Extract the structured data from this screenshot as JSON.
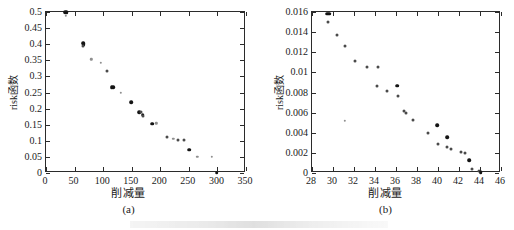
{
  "figure": {
    "background_color": "#ffffff",
    "marker_color": "#4a4a4a",
    "marker_color_dark": "#141414",
    "marker_color_light": "#8f8f8f",
    "axis_color": "#2b2b2b",
    "footer_artifact_label": "cut-off-caption-artifact"
  },
  "chart_data": [
    {
      "type": "scatter",
      "panel": "a",
      "caption": "(a)",
      "title": "",
      "xlabel": "削减量",
      "ylabel": "risk函数",
      "xlim": [
        0,
        350
      ],
      "ylim": [
        0,
        0.5
      ],
      "xticks": [
        0,
        50,
        100,
        150,
        200,
        250,
        300,
        350
      ],
      "xticklabels": [
        "0",
        "50",
        "100",
        "150",
        "200",
        "250",
        "300",
        "350"
      ],
      "yticks": [
        0,
        0.05,
        0.1,
        0.15,
        0.2,
        0.25,
        0.3,
        0.35,
        0.4,
        0.45,
        0.5
      ],
      "yticklabels": [
        "0",
        "0.05",
        "0.1",
        "0.15",
        "0.2",
        "0.25",
        "0.3",
        "0.35",
        "0.4",
        "0.45",
        "0.5"
      ],
      "grid": false,
      "legend": false,
      "points": [
        {
          "x": 34,
          "y": 0.4985,
          "w": "dark"
        },
        {
          "x": 36,
          "y": 0.4985,
          "w": "dark"
        },
        {
          "x": 35,
          "y": 0.4885,
          "w": "light"
        },
        {
          "x": 65,
          "y": 0.4035,
          "w": "dark"
        },
        {
          "x": 66,
          "y": 0.3985,
          "w": "dark"
        },
        {
          "x": 65,
          "y": 0.3955,
          "w": "normal"
        },
        {
          "x": 79,
          "y": 0.3525,
          "w": "light"
        },
        {
          "x": 96,
          "y": 0.3425,
          "w": "light"
        },
        {
          "x": 106,
          "y": 0.3165,
          "w": "normal"
        },
        {
          "x": 115,
          "y": 0.2665,
          "w": "dark"
        },
        {
          "x": 118,
          "y": 0.2665,
          "w": "dark"
        },
        {
          "x": 131,
          "y": 0.2485,
          "w": "light"
        },
        {
          "x": 149,
          "y": 0.2205,
          "w": "dark"
        },
        {
          "x": 163,
          "y": 0.1895,
          "w": "dark"
        },
        {
          "x": 166,
          "y": 0.1885,
          "w": "normal"
        },
        {
          "x": 169,
          "y": 0.1805,
          "w": "dark"
        },
        {
          "x": 170,
          "y": 0.1775,
          "w": "normal"
        },
        {
          "x": 186,
          "y": 0.1525,
          "w": "dark"
        },
        {
          "x": 193,
          "y": 0.1545,
          "w": "light"
        },
        {
          "x": 212,
          "y": 0.1115,
          "w": "normal"
        },
        {
          "x": 223,
          "y": 0.1055,
          "w": "light"
        },
        {
          "x": 231,
          "y": 0.1025,
          "w": "normal"
        },
        {
          "x": 241,
          "y": 0.1025,
          "w": "normal"
        },
        {
          "x": 251,
          "y": 0.0725,
          "w": "dark"
        },
        {
          "x": 265,
          "y": 0.0505,
          "w": "light"
        },
        {
          "x": 290,
          "y": 0.0505,
          "w": "light"
        },
        {
          "x": 299,
          "y": 0.0015,
          "w": "dark"
        }
      ]
    },
    {
      "type": "scatter",
      "panel": "b",
      "caption": "(b)",
      "title": "",
      "xlabel": "削减量",
      "ylabel": "risk函数",
      "xlim": [
        28,
        46
      ],
      "ylim": [
        0,
        0.016
      ],
      "xticks": [
        28,
        30,
        32,
        34,
        36,
        38,
        40,
        42,
        44,
        46
      ],
      "xticklabels": [
        "28",
        "30",
        "32",
        "34",
        "36",
        "38",
        "40",
        "42",
        "44",
        "46"
      ],
      "yticks": [
        0,
        0.002,
        0.004,
        0.006,
        0.008,
        0.01,
        0.012,
        0.014,
        0.016
      ],
      "yticklabels": [
        "0",
        "0.002",
        "0.004",
        "0.006",
        "0.008",
        "0.01",
        "0.012",
        "0.014",
        "0.016"
      ],
      "grid": false,
      "legend": false,
      "points": [
        {
          "x": 29.45,
          "y": 0.01585,
          "w": "dark"
        },
        {
          "x": 29.65,
          "y": 0.01585,
          "w": "dark"
        },
        {
          "x": 29.55,
          "y": 0.01505,
          "w": "normal"
        },
        {
          "x": 30.4,
          "y": 0.0137,
          "w": "normal"
        },
        {
          "x": 31.1,
          "y": 0.01258,
          "w": "normal"
        },
        {
          "x": 32.05,
          "y": 0.01118,
          "w": "normal"
        },
        {
          "x": 33.25,
          "y": 0.01055,
          "w": "normal"
        },
        {
          "x": 34.25,
          "y": 0.01052,
          "w": "normal"
        },
        {
          "x": 34.2,
          "y": 0.00862,
          "w": "normal"
        },
        {
          "x": 36.1,
          "y": 0.00868,
          "w": "dark"
        },
        {
          "x": 35.15,
          "y": 0.00815,
          "w": "normal"
        },
        {
          "x": 36.2,
          "y": 0.00765,
          "w": "normal"
        },
        {
          "x": 36.8,
          "y": 0.00618,
          "w": "normal"
        },
        {
          "x": 36.95,
          "y": 0.006,
          "w": "normal"
        },
        {
          "x": 31.15,
          "y": 0.00518,
          "w": "light"
        },
        {
          "x": 37.6,
          "y": 0.00522,
          "w": "normal"
        },
        {
          "x": 39.0,
          "y": 0.004,
          "w": "normal"
        },
        {
          "x": 39.95,
          "y": 0.00477,
          "w": "dark"
        },
        {
          "x": 40.0,
          "y": 0.0029,
          "w": "normal"
        },
        {
          "x": 40.85,
          "y": 0.00358,
          "w": "dark"
        },
        {
          "x": 40.9,
          "y": 0.00262,
          "w": "normal"
        },
        {
          "x": 41.2,
          "y": 0.00235,
          "w": "normal"
        },
        {
          "x": 42.15,
          "y": 0.00208,
          "w": "normal"
        },
        {
          "x": 42.6,
          "y": 0.00196,
          "w": "normal"
        },
        {
          "x": 42.95,
          "y": 0.00125,
          "w": "dark"
        },
        {
          "x": 43.25,
          "y": 0.00035,
          "w": "normal"
        },
        {
          "x": 43.9,
          "y": 0.00018,
          "w": "normal"
        },
        {
          "x": 44.05,
          "y": 0.0001,
          "w": "dark"
        }
      ]
    }
  ]
}
